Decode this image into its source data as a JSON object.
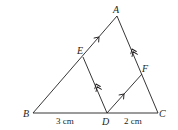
{
  "diagram": {
    "type": "triangle-with-parallels",
    "points": {
      "A": {
        "label": "A",
        "x": 117,
        "y": 16
      },
      "B": {
        "label": "B",
        "x": 33,
        "y": 113
      },
      "C": {
        "label": "C",
        "x": 158,
        "y": 113
      },
      "D": {
        "label": "D",
        "x": 107,
        "y": 113
      },
      "E": {
        "label": "E",
        "x": 83,
        "y": 57
      },
      "F": {
        "label": "F",
        "x": 142,
        "y": 74
      }
    },
    "segments": [
      "AB",
      "BC",
      "CA",
      "DE",
      "DF"
    ],
    "parallel_marks": [
      {
        "segments": [
          "BA",
          "DF"
        ],
        "mark": "single-arrow"
      },
      {
        "segments": [
          "CA",
          "DE"
        ],
        "mark": "double-arrow"
      }
    ],
    "measurements": {
      "BD": "3 cm",
      "DC": "2 cm"
    }
  }
}
